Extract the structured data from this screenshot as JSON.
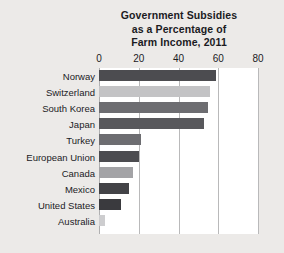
{
  "chart_data": {
    "type": "bar",
    "orientation": "horizontal",
    "title": "Government Subsidies as a Percentage of Farm Income, 2011",
    "title_lines": [
      "Government Subsidies",
      "as a Percentage of",
      "Farm Income, 2011"
    ],
    "xlabel": "",
    "ylabel": "",
    "xlim": [
      0,
      80
    ],
    "xticks": [
      0,
      20,
      40,
      60,
      80
    ],
    "xtick_labels": [
      "0",
      "20",
      "40",
      "60",
      "80"
    ],
    "grid": "vertical",
    "legend": "none",
    "categories": [
      "Norway",
      "Switzerland",
      "South Korea",
      "Japan",
      "Turkey",
      "European Union",
      "Canada",
      "Mexico",
      "United States",
      "Australia"
    ],
    "values": [
      59,
      56,
      55,
      53,
      21,
      20,
      17,
      15,
      11,
      3
    ],
    "bar_colors": [
      "#4c4c50",
      "#c3c3c5",
      "#6d6d71",
      "#58585c",
      "#6d6d71",
      "#4c4c50",
      "#a3a3a6",
      "#434347",
      "#3a3a3e",
      "#cdcdcf"
    ]
  },
  "colors": {
    "page_background": "#eceae8",
    "plot_background": "#ffffff",
    "gridline": "#b9b9ba",
    "text": "#1b1b1f"
  }
}
